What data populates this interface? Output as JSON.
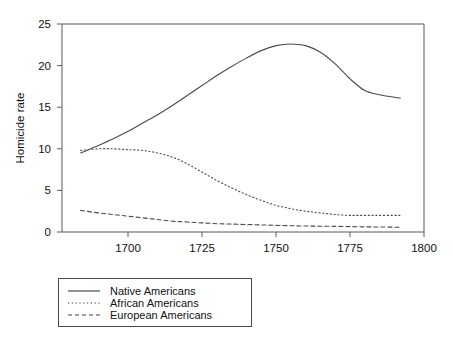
{
  "chart_data": {
    "type": "line",
    "title": "",
    "xlabel": "",
    "ylabel": "Homicide rate",
    "xlim": [
      1677.7,
      1800
    ],
    "ylim": [
      0,
      25
    ],
    "grid": false,
    "legend_position": "below-plot",
    "x_ticks": [
      1700,
      1725,
      1750,
      1775,
      1800
    ],
    "x_tick_labels": [
      "1700",
      "1725",
      "1750",
      "1775",
      "1800"
    ],
    "y_ticks": [
      0,
      5,
      10,
      15,
      20,
      25
    ],
    "y_tick_labels": [
      "0",
      "5",
      "10",
      "15",
      "20",
      "25"
    ],
    "series": [
      {
        "name": "Native Americans",
        "style": "solid",
        "x": [
          1684,
          1690,
          1695,
          1700,
          1705,
          1710,
          1715,
          1720,
          1725,
          1730,
          1735,
          1740,
          1745,
          1750,
          1755,
          1760,
          1765,
          1770,
          1775,
          1780,
          1785,
          1790,
          1792
        ],
        "values": [
          9.5,
          10.4,
          11.2,
          12.1,
          13.1,
          14.1,
          15.2,
          16.4,
          17.6,
          18.8,
          19.9,
          20.9,
          21.8,
          22.4,
          22.6,
          22.4,
          21.6,
          20.2,
          18.4,
          17.0,
          16.5,
          16.2,
          16.1
        ]
      },
      {
        "name": "African Americans",
        "style": "dotted",
        "x": [
          1684,
          1690,
          1695,
          1700,
          1705,
          1710,
          1715,
          1720,
          1725,
          1730,
          1735,
          1740,
          1745,
          1750,
          1755,
          1760,
          1765,
          1770,
          1775,
          1780,
          1785,
          1790,
          1792
        ],
        "values": [
          9.8,
          10.0,
          10.0,
          9.9,
          9.8,
          9.5,
          9.0,
          8.2,
          7.2,
          6.2,
          5.3,
          4.5,
          3.8,
          3.2,
          2.8,
          2.5,
          2.3,
          2.1,
          2.0,
          2.0,
          2.0,
          2.0,
          2.0
        ]
      },
      {
        "name": "European Americans",
        "style": "dashed",
        "x": [
          1684,
          1690,
          1695,
          1700,
          1705,
          1710,
          1715,
          1720,
          1725,
          1730,
          1735,
          1740,
          1745,
          1750,
          1755,
          1760,
          1765,
          1770,
          1775,
          1780,
          1785,
          1790,
          1792
        ],
        "values": [
          2.6,
          2.3,
          2.1,
          1.9,
          1.7,
          1.5,
          1.3,
          1.2,
          1.1,
          1.0,
          0.95,
          0.9,
          0.85,
          0.8,
          0.75,
          0.72,
          0.7,
          0.68,
          0.65,
          0.62,
          0.6,
          0.58,
          0.57
        ]
      }
    ]
  },
  "legend": {
    "entries": [
      {
        "label": "Native Americans"
      },
      {
        "label": "African Americans"
      },
      {
        "label": "European Americans"
      }
    ]
  },
  "colors": {
    "axis": "#5a5a5a",
    "line": "#4a4a4a",
    "text": "#111111",
    "background": "#ffffff"
  }
}
